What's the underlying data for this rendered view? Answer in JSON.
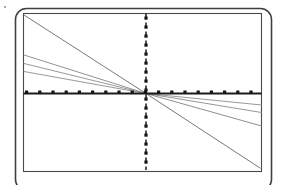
{
  "figure": {
    "title": "",
    "background_color": "#ffffff",
    "ink_color": "#6e6e6e",
    "axis_color": "#1a1a1a",
    "frame_color": "#3a3a3a"
  },
  "frame": {
    "outer_border": {
      "name": "rounded-outer-frame",
      "x": 15.5,
      "y": 8.5,
      "width": 256,
      "height": 182,
      "rx": 11,
      "stroke_width": 1.6,
      "color": "#3f3f3f"
    },
    "inner_border": {
      "name": "plot-area-frame",
      "x": 23.5,
      "y": 13.5,
      "width": 238,
      "height": 158,
      "stroke_width": 1.1,
      "color": "#4a4a4a"
    },
    "corner_speck": {
      "x": 4,
      "y": 6,
      "size": 2.4
    }
  },
  "axes": {
    "origin": {
      "x": 146,
      "y": 93.5
    },
    "horizontal": {
      "name": "horizontal-axis",
      "label": "",
      "y": 93.5,
      "x_start": 23.5,
      "x_end": 261.5,
      "stroke_width": 1.9,
      "color": "#1c1c1c",
      "marker_style": "square-dots",
      "marker_size": 3.2,
      "marker_spacing": 13.2,
      "marker_offset_y": -3.0,
      "marker_color": "#151515"
    },
    "vertical": {
      "name": "vertical-axis",
      "label": "",
      "x": 146,
      "y_start": 13.5,
      "y_end": 171.5,
      "stroke_width": 1.5,
      "color": "#1c1c1c",
      "dash_pattern": "3.4 5.6",
      "marker_style": "square-dots",
      "marker_size": 3.2,
      "marker_spacing": 9.0,
      "marker_color": "#151515"
    }
  },
  "chart_data": {
    "type": "line",
    "title": "",
    "subtitle": "",
    "xlabel": "",
    "ylabel": "",
    "xlim": [
      23.5,
      261.5
    ],
    "ylim": [
      171.5,
      13.5
    ],
    "grid": false,
    "legend": "none",
    "annotations": [],
    "axis_lines": {
      "x_axis_at_y": 93.5,
      "y_axis_at_x": 146
    },
    "note": "All series are straight lines that pass through the common origin (146, 93.5). Coordinates are given in image pixel space: x increases rightward, y increases downward.",
    "series": [
      {
        "name": "line-1-steep-upper-left",
        "quadrant": "upper-left",
        "x": [
          24,
          146
        ],
        "y": [
          15,
          93.5
        ],
        "stroke_width": 1.0,
        "color": "#7a7a7a"
      },
      {
        "name": "line-2-shallow-upper-left",
        "quadrant": "upper-left",
        "x": [
          24,
          146
        ],
        "y": [
          55,
          93.5
        ],
        "stroke_width": 0.9,
        "color": "#868686"
      },
      {
        "name": "line-3-shallow-upper-left",
        "quadrant": "upper-left",
        "x": [
          24,
          146
        ],
        "y": [
          63.5,
          93.5
        ],
        "stroke_width": 0.9,
        "color": "#8d8d8d"
      },
      {
        "name": "line-4-shallow-upper-left",
        "quadrant": "upper-left",
        "x": [
          24,
          146
        ],
        "y": [
          71.5,
          93.5
        ],
        "stroke_width": 0.9,
        "color": "#8d8d8d"
      },
      {
        "name": "line-5-shallow-lower-right",
        "quadrant": "lower-right",
        "x": [
          146,
          261.5
        ],
        "y": [
          93.5,
          105
        ],
        "stroke_width": 0.9,
        "color": "#8d8d8d"
      },
      {
        "name": "line-6-shallow-lower-right",
        "quadrant": "lower-right",
        "x": [
          146,
          261.5
        ],
        "y": [
          93.5,
          112.5
        ],
        "stroke_width": 0.9,
        "color": "#8a8a8a"
      },
      {
        "name": "line-7-medium-lower-right",
        "quadrant": "lower-right",
        "x": [
          146,
          261.5
        ],
        "y": [
          93.5,
          126
        ],
        "stroke_width": 0.9,
        "color": "#828282"
      },
      {
        "name": "line-8-steep-lower-right",
        "quadrant": "lower-right",
        "x": [
          146,
          260
        ],
        "y": [
          93.5,
          168
        ],
        "stroke_width": 1.0,
        "color": "#787878"
      }
    ]
  }
}
